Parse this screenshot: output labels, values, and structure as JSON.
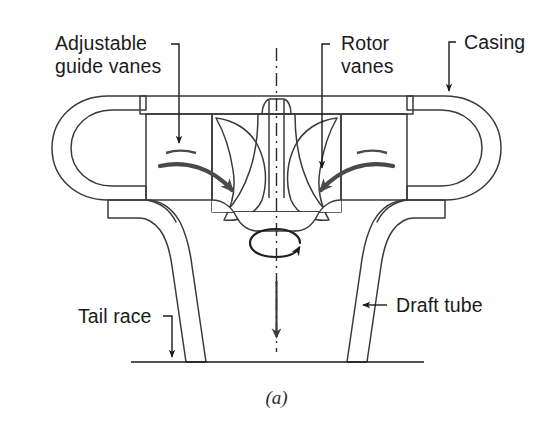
{
  "figure": {
    "caption": "(a)",
    "background_color": "#ffffff",
    "line_color": "#3a3a3a",
    "metal_fill_color": "#d7d7d7",
    "text_color": "#1b1b1b"
  },
  "labels": {
    "guide_vanes_line1": "Adjustable",
    "guide_vanes_line2": "guide vanes",
    "rotor_vanes_line1": "Rotor",
    "rotor_vanes_line2": "vanes",
    "casing": "Casing",
    "tail_race": "Tail race",
    "draft_tube": "Draft tube"
  },
  "parts": [
    {
      "id": "casing",
      "name": "Casing",
      "description": "Spiral volute shown in section as rings on both sides"
    },
    {
      "id": "guide-vanes",
      "name": "Adjustable guide vanes",
      "description": "Rectangular vane blocks flanking the runner"
    },
    {
      "id": "rotor-vanes",
      "name": "Rotor vanes",
      "description": "Curved runner blades on the central hub"
    },
    {
      "id": "draft-tube",
      "name": "Draft tube",
      "description": "Flaring outlet conduit below the runner"
    },
    {
      "id": "tail-race",
      "name": "Tail race",
      "description": "Horizontal downstream water level line"
    }
  ],
  "annotations": {
    "rotation_indicator": "shaft rotation ellipse arrow",
    "outflow_direction": "downward arrow through draft tube",
    "inflow_left": "curved arrow entering runner from left",
    "inflow_right": "curved arrow entering runner from right"
  }
}
